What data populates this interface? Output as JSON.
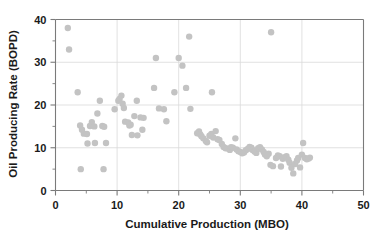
{
  "chart_data": {
    "type": "scatter",
    "title": "",
    "xlabel": "Cumulative Production (MBO)",
    "ylabel": "Oil Producing Rate (BOPD)",
    "xlim": [
      0,
      50
    ],
    "ylim": [
      0,
      40
    ],
    "xticks": [
      0,
      10,
      20,
      30,
      40,
      50
    ],
    "yticks": [
      0,
      10,
      20,
      30,
      40
    ],
    "xtick_labels": [
      "0",
      "10",
      "20",
      "30",
      "40",
      "50"
    ],
    "ytick_labels": [
      "0",
      "10",
      "20",
      "30",
      "40"
    ],
    "xminor_step": 5,
    "yminor_step": 5,
    "grid": true,
    "legend": null,
    "marker": {
      "shape": "circle",
      "color": "#c3c3c3",
      "size": 4.2
    },
    "series": [
      {
        "name": "wells",
        "points": [
          [
            2.0,
            38.0
          ],
          [
            2.2,
            33.0
          ],
          [
            3.6,
            23.0
          ],
          [
            4.0,
            15.2
          ],
          [
            4.3,
            14.2
          ],
          [
            4.6,
            13.3
          ],
          [
            5.1,
            13.2
          ],
          [
            5.2,
            11.0
          ],
          [
            5.6,
            15.1
          ],
          [
            5.9,
            16.0
          ],
          [
            6.3,
            15.0
          ],
          [
            6.4,
            11.1
          ],
          [
            6.8,
            18.0
          ],
          [
            7.2,
            21.0
          ],
          [
            7.6,
            15.1
          ],
          [
            7.9,
            14.9
          ],
          [
            8.2,
            11.1
          ],
          [
            4.1,
            5.0
          ],
          [
            7.8,
            5.0
          ],
          [
            9.6,
            19.0
          ],
          [
            10.2,
            21.0
          ],
          [
            10.4,
            21.4
          ],
          [
            10.7,
            22.2
          ],
          [
            10.9,
            20.3
          ],
          [
            11.1,
            19.3
          ],
          [
            11.3,
            16.1
          ],
          [
            11.8,
            15.9
          ],
          [
            12.0,
            15.2
          ],
          [
            12.2,
            15.4
          ],
          [
            12.4,
            13.0
          ],
          [
            12.8,
            17.4
          ],
          [
            13.2,
            21.0
          ],
          [
            13.3,
            12.9
          ],
          [
            13.8,
            17.1
          ],
          [
            14.1,
            14.2
          ],
          [
            14.3,
            17.0
          ],
          [
            16.0,
            24.0
          ],
          [
            16.3,
            31.0
          ],
          [
            16.8,
            19.2
          ],
          [
            17.6,
            19.0
          ],
          [
            18.0,
            16.2
          ],
          [
            19.3,
            23.0
          ],
          [
            20.0,
            31.0
          ],
          [
            20.6,
            29.2
          ],
          [
            21.2,
            24.0
          ],
          [
            21.7,
            36.0
          ],
          [
            21.9,
            19.1
          ],
          [
            23.0,
            13.4
          ],
          [
            23.3,
            13.8
          ],
          [
            23.5,
            13.1
          ],
          [
            23.7,
            12.7
          ],
          [
            24.0,
            12.2
          ],
          [
            24.4,
            11.6
          ],
          [
            24.6,
            11.3
          ],
          [
            25.0,
            12.8
          ],
          [
            25.3,
            13.2
          ],
          [
            25.6,
            12.4
          ],
          [
            25.4,
            23.0
          ],
          [
            26.0,
            13.9
          ],
          [
            26.3,
            12.0
          ],
          [
            26.6,
            11.8
          ],
          [
            27.0,
            10.9
          ],
          [
            27.3,
            10.2
          ],
          [
            27.6,
            9.9
          ],
          [
            28.0,
            9.8
          ],
          [
            28.3,
            9.5
          ],
          [
            28.5,
            10.1
          ],
          [
            28.8,
            10.0
          ],
          [
            29.2,
            12.2
          ],
          [
            29.4,
            9.6
          ],
          [
            29.7,
            9.2
          ],
          [
            30.0,
            9.0
          ],
          [
            30.3,
            8.7
          ],
          [
            30.6,
            8.9
          ],
          [
            30.9,
            9.4
          ],
          [
            31.2,
            9.7
          ],
          [
            31.5,
            10.2
          ],
          [
            31.8,
            10.0
          ],
          [
            32.0,
            9.5
          ],
          [
            32.3,
            9.1
          ],
          [
            32.6,
            8.8
          ],
          [
            32.9,
            9.9
          ],
          [
            33.2,
            10.1
          ],
          [
            33.5,
            9.6
          ],
          [
            33.8,
            9.0
          ],
          [
            34.0,
            8.4
          ],
          [
            34.3,
            8.0
          ],
          [
            34.6,
            8.6
          ],
          [
            34.9,
            6.0
          ],
          [
            35.0,
            37.0
          ],
          [
            35.3,
            5.7
          ],
          [
            35.8,
            7.6
          ],
          [
            36.1,
            8.2
          ],
          [
            36.4,
            8.0
          ],
          [
            36.6,
            5.6
          ],
          [
            36.9,
            7.4
          ],
          [
            37.2,
            7.8
          ],
          [
            37.5,
            8.0
          ],
          [
            37.8,
            7.2
          ],
          [
            38.0,
            6.5
          ],
          [
            38.3,
            5.3
          ],
          [
            38.6,
            4.0
          ],
          [
            38.9,
            6.2
          ],
          [
            39.2,
            7.0
          ],
          [
            39.4,
            7.6
          ],
          [
            39.7,
            5.4
          ],
          [
            40.0,
            8.4
          ],
          [
            40.2,
            11.1
          ],
          [
            40.5,
            7.6
          ],
          [
            40.8,
            7.3
          ],
          [
            41.1,
            7.5
          ],
          [
            41.3,
            7.7
          ]
        ]
      }
    ]
  }
}
